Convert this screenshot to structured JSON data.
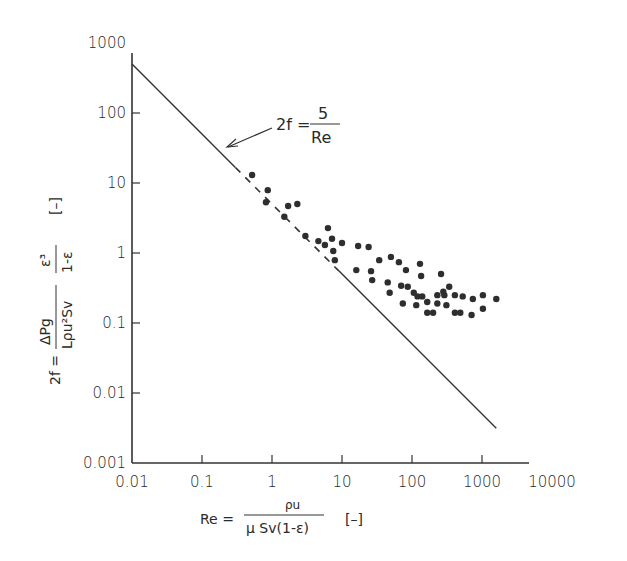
{
  "chart_data": {
    "type": "scatter",
    "title": "",
    "xscale": "log",
    "yscale": "log",
    "xlim": [
      0.01,
      10000
    ],
    "ylim": [
      0.001,
      1000
    ],
    "grid": false,
    "legend": null,
    "x_ticks": [
      "0.01",
      "0.1",
      "1",
      "10",
      "100",
      "1000",
      "10000"
    ],
    "y_ticks": [
      "0.001",
      "0.01",
      "0.1",
      "1",
      "10",
      "100",
      "1000"
    ],
    "xlabel": {
      "prefix": "Re =",
      "numerator": "ρu",
      "denominator": "μ Sv(1-ε)",
      "unit": "[–]"
    },
    "ylabel": {
      "prefix": "2f =",
      "numerator1": "ΔPg",
      "denominator1": "Lρu²Sv",
      "numerator2": "ε³",
      "denominator2": "1-ε",
      "unit": "[–]"
    },
    "line": {
      "name": "2f = 5/Re",
      "equation": "2f = 5/Re",
      "x": [
        0.01,
        1600
      ],
      "y": [
        500,
        0.003125
      ],
      "dashed_range": [
        0.3,
        9
      ]
    },
    "annotation": {
      "left": "2f =",
      "numerator": "5",
      "denominator": "Re"
    },
    "series": [
      {
        "name": "experimental data",
        "points": [
          [
            0.52,
            13.0
          ],
          [
            0.87,
            7.9
          ],
          [
            0.82,
            5.3
          ],
          [
            1.7,
            4.7
          ],
          [
            2.3,
            5.0
          ],
          [
            1.5,
            3.3
          ],
          [
            3.0,
            1.75
          ],
          [
            4.6,
            1.48
          ],
          [
            6.3,
            2.27
          ],
          [
            7.2,
            1.6
          ],
          [
            5.7,
            1.3
          ],
          [
            7.5,
            1.07
          ],
          [
            10,
            1.39
          ],
          [
            17,
            1.26
          ],
          [
            24,
            1.22
          ],
          [
            7.9,
            0.79
          ],
          [
            34,
            0.79
          ],
          [
            50,
            0.88
          ],
          [
            65,
            0.74
          ],
          [
            82,
            0.57
          ],
          [
            130,
            0.7
          ],
          [
            135,
            0.47
          ],
          [
            260,
            0.5
          ],
          [
            16,
            0.57
          ],
          [
            26,
            0.55
          ],
          [
            27,
            0.41
          ],
          [
            45,
            0.38
          ],
          [
            48,
            0.27
          ],
          [
            70,
            0.34
          ],
          [
            87,
            0.33
          ],
          [
            106,
            0.27
          ],
          [
            120,
            0.24
          ],
          [
            140,
            0.24
          ],
          [
            165,
            0.2
          ],
          [
            230,
            0.25
          ],
          [
            280,
            0.28
          ],
          [
            74,
            0.19
          ],
          [
            115,
            0.18
          ],
          [
            230,
            0.19
          ],
          [
            165,
            0.14
          ],
          [
            200,
            0.14
          ],
          [
            290,
            0.25
          ],
          [
            340,
            0.33
          ],
          [
            410,
            0.25
          ],
          [
            530,
            0.24
          ],
          [
            740,
            0.22
          ],
          [
            1030,
            0.25
          ],
          [
            1600,
            0.22
          ],
          [
            310,
            0.18
          ],
          [
            410,
            0.14
          ],
          [
            490,
            0.14
          ],
          [
            710,
            0.13
          ],
          [
            1030,
            0.16
          ]
        ]
      }
    ]
  }
}
